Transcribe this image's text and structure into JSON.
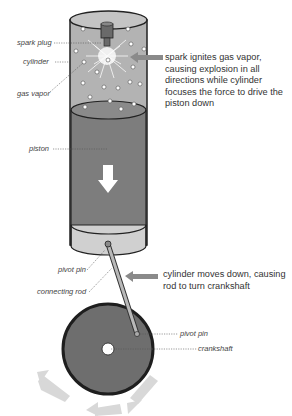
{
  "labels": {
    "spark_plug": "spark plug",
    "cylinder": "cylinder",
    "gas_vapor": "gas vapor",
    "piston": "piston",
    "pivot_pin_top": "pivot pin",
    "connecting_rod": "connecting rod",
    "pivot_pin_bottom": "pivot pin",
    "crankshaft": "crankshaft"
  },
  "captions": {
    "ignition": "spark ignites gas vapor, causing explosion in all directions while cylinder focuses the force to drive the piston down",
    "rod": "cylinder moves down, causing rod to turn crankshaft"
  },
  "icons": [
    "down-arrow-icon",
    "left-arrow-icon",
    "rotation-arrow-icon",
    "spark-burst-icon"
  ],
  "colors": {
    "cylinder_fill": "#b5b5b5",
    "piston_fill": "#7d7d7d",
    "piston_skirt": "#cfcfcf",
    "crank_fill": "#6e6e6e",
    "outline": "#222222",
    "arrow_gray": "#8a8a8a",
    "rotation_arrow": "#d8d8d8"
  }
}
